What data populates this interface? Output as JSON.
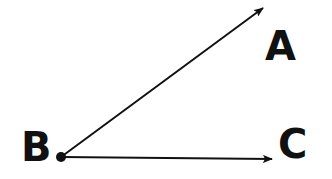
{
  "diagram": {
    "type": "angle",
    "colors": {
      "stroke": "#111111",
      "background": "#ffffff"
    },
    "points": {
      "A": {
        "label": "A"
      },
      "B": {
        "label": "B"
      },
      "C": {
        "label": "C"
      }
    },
    "rays": [
      {
        "from": "B",
        "toward": "A"
      },
      {
        "from": "B",
        "toward": "C"
      }
    ]
  }
}
